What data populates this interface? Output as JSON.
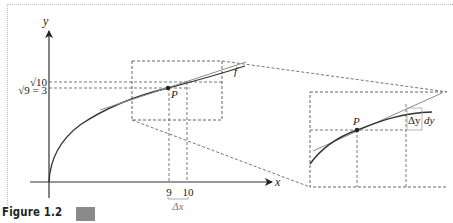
{
  "figure": {
    "caption": "Figure 1.2",
    "swatch_color": "#8a8a8a"
  },
  "axes": {
    "x_label": "x",
    "y_label": "y",
    "y_ticks": [
      {
        "label": "√10",
        "value": 3.162
      },
      {
        "label": "√9 = 3",
        "value": 3
      }
    ],
    "x_ticks": [
      {
        "label": "9",
        "value": 9
      },
      {
        "label": "10",
        "value": 10
      }
    ],
    "delta_x_label": "Δx"
  },
  "curve": {
    "name": "f",
    "function": "y = √x"
  },
  "point": {
    "label": "P",
    "x": 9,
    "y": 3
  },
  "inset": {
    "point_label": "P",
    "delta_y_label": "Δy",
    "dy_label": "dy"
  },
  "colors": {
    "curve": "#333333",
    "tangent": "#8c8c8c",
    "dashed": "#555555",
    "axis": "#333333"
  }
}
